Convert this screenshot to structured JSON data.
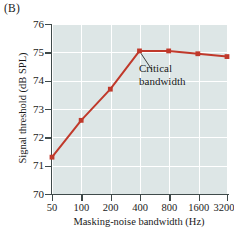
{
  "panel": {
    "label": "(B)"
  },
  "chart_data": {
    "type": "line",
    "title": "",
    "xlabel": "Masking-noise bandwidth (Hz)",
    "ylabel": "Signal threshold (dB SPL)",
    "xscale": "log2",
    "categories": [
      "50",
      "100",
      "200",
      "400",
      "800",
      "1600",
      "3200"
    ],
    "x": [
      50,
      100,
      200,
      400,
      800,
      1600,
      3200
    ],
    "values": [
      71.3,
      72.6,
      73.7,
      75.05,
      75.05,
      74.95,
      74.85
    ],
    "xtick_labels": [
      "50",
      "100",
      "200",
      "400",
      "800",
      "1600",
      "3200"
    ],
    "ytick_labels": [
      "70",
      "71",
      "72",
      "73",
      "74",
      "75",
      "76"
    ],
    "yticks": [
      70,
      71,
      72,
      73,
      74,
      75,
      76
    ],
    "ylim": [
      70,
      76
    ],
    "grid": true,
    "legend": "none",
    "series_color": "#c0392b",
    "plot_background": "#dde6e6",
    "gridline_color": "#ffffff",
    "axis_color": "#3f4a4a",
    "annotations": [
      {
        "name": "critical-bandwidth",
        "line1": "Critical",
        "line2": "bandwidth",
        "points_to_x": 400,
        "points_to_y": 75.05
      }
    ]
  },
  "edge_artifact": {
    "text": ""
  }
}
